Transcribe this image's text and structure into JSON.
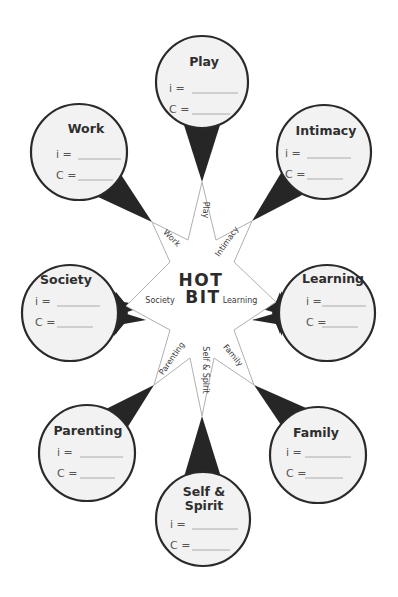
{
  "center": {
    "line1": "HOT",
    "line2": "BIT"
  },
  "colors": {
    "bubble_fill": "#f2f2f2",
    "bubble_stroke": "#2a2a2a",
    "pointer_fill": "#262626",
    "star_stroke": "#b0b0b0",
    "blank_line": "#9a9a9a"
  },
  "star_labels": {
    "play": "Play",
    "intimacy": "Intimacy",
    "learning": "Learning",
    "family": "Family",
    "self_spirit": "Self & Spirit",
    "parenting": "Parenting",
    "society": "Society",
    "work": "Work"
  },
  "bubbles": {
    "play": {
      "title": "Play",
      "i_label": "i =",
      "c_label": "C ="
    },
    "intimacy": {
      "title": "Intimacy",
      "i_label": "i =",
      "c_label": "C ="
    },
    "learning": {
      "title": "Learning",
      "i_label": "i =",
      "c_label": "C ="
    },
    "family": {
      "title": "Family",
      "i_label": "i =",
      "c_label": "C ="
    },
    "self_spirit": {
      "title_line1": "Self &",
      "title_line2": "Spirit",
      "i_label": "i =",
      "c_label": "C ="
    },
    "parenting": {
      "title": "Parenting",
      "i_label": "i =",
      "c_label": "C ="
    },
    "society": {
      "title": "Society",
      "i_label": "i =",
      "c_label": "C ="
    },
    "work": {
      "title": "Work",
      "i_label": "i =",
      "c_label": "C ="
    }
  }
}
